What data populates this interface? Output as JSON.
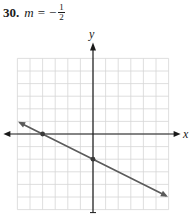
{
  "problem": {
    "number": "30.",
    "variable": "m",
    "equals": "=",
    "sign": "−",
    "numerator": "1",
    "denominator": "2"
  },
  "chart_data": {
    "type": "line",
    "xlabel": "x",
    "ylabel": "y",
    "grid": true,
    "xlim": [
      -6,
      6
    ],
    "ylim": [
      -6,
      6
    ],
    "ticks_labeled": false,
    "series": [
      {
        "name": "line with slope -1/2",
        "slope": -0.5,
        "intercept": -2,
        "x": [
          -4,
          0
        ],
        "y": [
          0,
          -2
        ],
        "marked_points": [
          {
            "x": -4,
            "y": 0,
            "label": "x-intercept"
          },
          {
            "x": 0,
            "y": -2,
            "label": "y-intercept"
          }
        ],
        "arrows_both_ends": true
      }
    ],
    "colors": {
      "grid": "#d6d6d6",
      "axes": "#1a1a1a",
      "line": "#5a5a5a",
      "points": "#3a3a3a"
    }
  },
  "labels": {
    "x_axis": "x",
    "y_axis": "y"
  }
}
